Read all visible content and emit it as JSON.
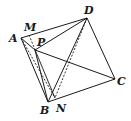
{
  "diagram": {
    "type": "tetrahedron",
    "points": {
      "A": {
        "label": "A",
        "x": 21,
        "y": 38,
        "lx": 9,
        "ly": 42
      },
      "M": {
        "label": "M",
        "x": 29,
        "y": 35,
        "lx": 24,
        "ly": 31
      },
      "D": {
        "label": "D",
        "x": 87,
        "y": 18,
        "lx": 84,
        "ly": 14
      },
      "P": {
        "label": "P",
        "x": 35,
        "y": 50,
        "lx": 37,
        "ly": 46
      },
      "C": {
        "label": "C",
        "x": 115,
        "y": 79,
        "lx": 117,
        "ly": 85
      },
      "B": {
        "label": "B",
        "x": 48,
        "y": 102,
        "lx": 40,
        "ly": 114
      },
      "N": {
        "label": "N",
        "x": 55,
        "y": 98,
        "lx": 56,
        "ly": 112
      }
    },
    "solid_edges": [
      "AD",
      "AB",
      "DC",
      "BC",
      "BD",
      "PD",
      "PC",
      "PB",
      "AP"
    ],
    "dashed_edges": [
      "AN",
      "MN",
      "DN"
    ]
  }
}
